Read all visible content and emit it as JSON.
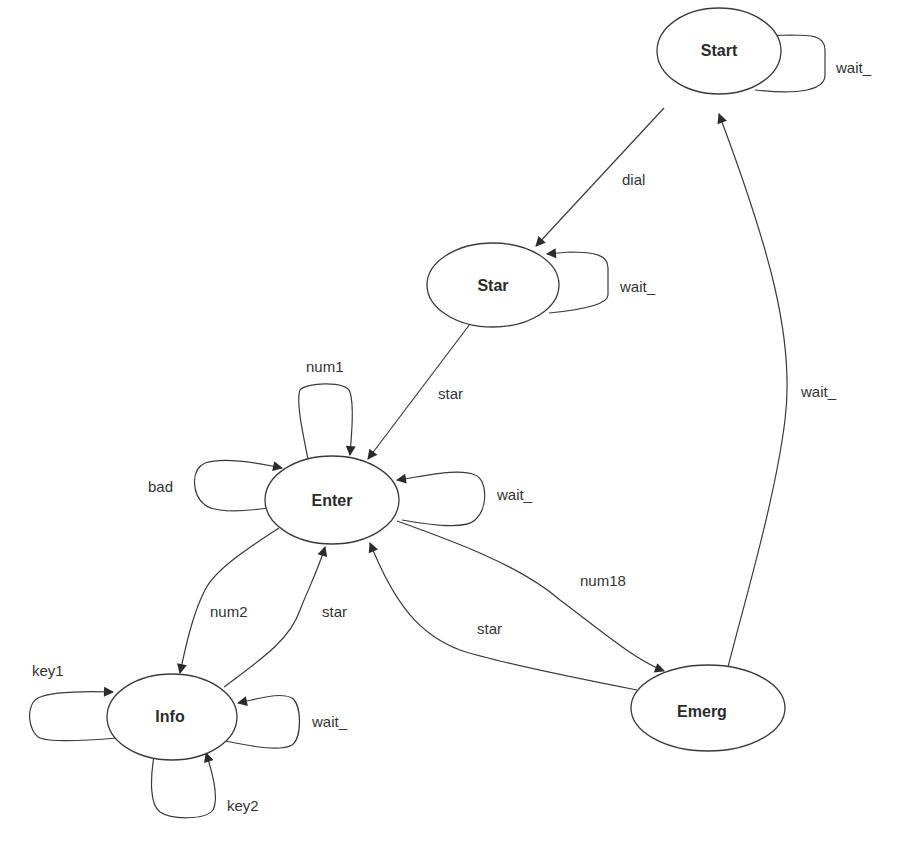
{
  "diagram": {
    "type": "state-machine",
    "nodes": [
      {
        "id": "start",
        "label": "Start"
      },
      {
        "id": "star",
        "label": "Star"
      },
      {
        "id": "enter",
        "label": "Enter"
      },
      {
        "id": "info",
        "label": "Info"
      },
      {
        "id": "emerg",
        "label": "Emerg"
      }
    ],
    "edges": [
      {
        "from": "start",
        "to": "start",
        "label": "wait_"
      },
      {
        "from": "start",
        "to": "star",
        "label": "dial"
      },
      {
        "from": "star",
        "to": "star",
        "label": "wait_"
      },
      {
        "from": "star",
        "to": "enter",
        "label": "star"
      },
      {
        "from": "enter",
        "to": "enter",
        "label": "num1"
      },
      {
        "from": "enter",
        "to": "enter",
        "label": "bad"
      },
      {
        "from": "enter",
        "to": "enter",
        "label": "wait_"
      },
      {
        "from": "enter",
        "to": "info",
        "label": "num2"
      },
      {
        "from": "info",
        "to": "enter",
        "label": "star"
      },
      {
        "from": "enter",
        "to": "emerg",
        "label": "num18"
      },
      {
        "from": "emerg",
        "to": "enter",
        "label": "star"
      },
      {
        "from": "emerg",
        "to": "start",
        "label": "wait_"
      },
      {
        "from": "info",
        "to": "info",
        "label": "key1"
      },
      {
        "from": "info",
        "to": "info",
        "label": "wait_"
      },
      {
        "from": "info",
        "to": "info",
        "label": "key2"
      }
    ]
  },
  "colors": {
    "stroke": "#3a3a3a",
    "background": "#ffffff",
    "text": "#2b2b2b"
  }
}
